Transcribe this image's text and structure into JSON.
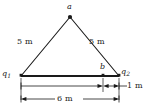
{
  "figure": {
    "background_color": "#ffffff",
    "line_color": "#1a1a1a",
    "text_color": "#1a1a1a",
    "points": [
      {
        "id": "a",
        "label": "a",
        "x": 70,
        "y": 17,
        "role": "apex-field-point"
      },
      {
        "id": "b",
        "label": "b",
        "x": 103,
        "y": 76,
        "role": "baseline-field-point"
      },
      {
        "id": "q1",
        "label": "q",
        "subscript": "1",
        "x": 21,
        "y": 76,
        "role": "charge-left"
      },
      {
        "id": "q2",
        "label": "q",
        "subscript": "2",
        "x": 119,
        "y": 76,
        "role": "charge-right"
      }
    ],
    "sides": [
      {
        "id": "left-side",
        "label": "5 m",
        "from": "q1",
        "to": "a"
      },
      {
        "id": "right-side",
        "label": "5 m",
        "from": "a",
        "to": "q2"
      }
    ],
    "dimensions": [
      {
        "id": "baseline-total",
        "label": "6 m",
        "from": "q1",
        "to": "q2",
        "value": 6,
        "unit": "m"
      },
      {
        "id": "b-to-q2",
        "label": "1 m",
        "from": "b",
        "to": "q2",
        "value": 1,
        "unit": "m"
      }
    ],
    "labels": {
      "apex": "a",
      "mid": "b",
      "charge_left": "q",
      "charge_left_sub": "1",
      "charge_right": "q",
      "charge_right_sub": "2",
      "side_left": "5 m",
      "side_right": "5 m",
      "base_total": "6 m",
      "base_segment": "1 m"
    }
  }
}
